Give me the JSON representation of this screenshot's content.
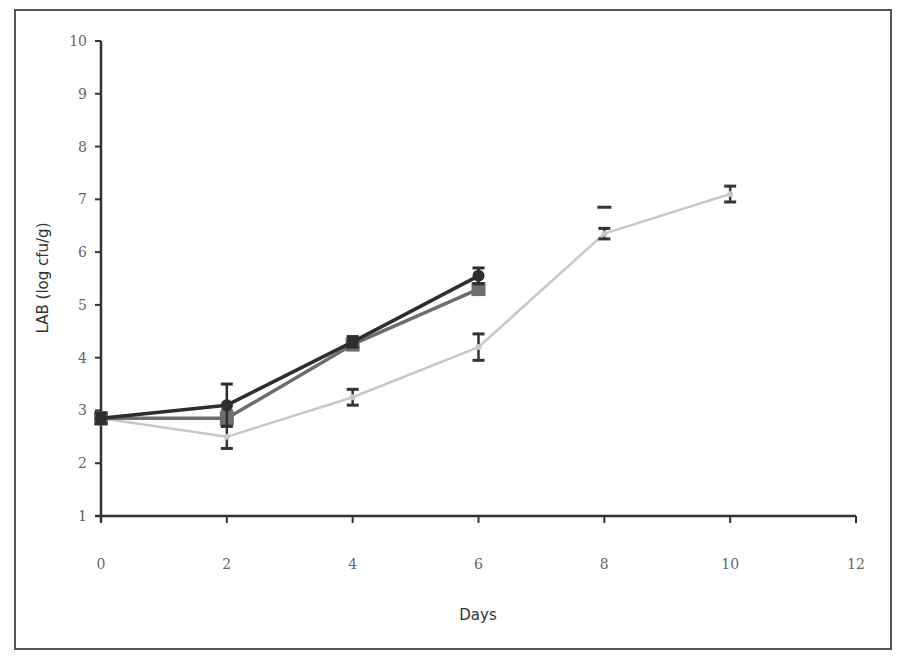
{
  "chart_data": {
    "type": "line",
    "title": "",
    "xlabel": "Days",
    "ylabel": "LAB (log cfu/g)",
    "xlim": [
      0,
      12
    ],
    "ylim": [
      1,
      10
    ],
    "x_ticks": [
      0,
      2,
      4,
      6,
      8,
      10,
      12
    ],
    "y_ticks": [
      1,
      2,
      3,
      4,
      5,
      6,
      7,
      8,
      9,
      10
    ],
    "grid": false,
    "legend": null,
    "series": [
      {
        "name": "Series 1 (dark, triangle/circle markers)",
        "color": "#2e2e2e",
        "x": [
          0,
          2,
          4,
          6
        ],
        "y": [
          2.85,
          3.1,
          4.3,
          5.55
        ],
        "error": [
          0.1,
          0.4,
          0.1,
          0.15
        ]
      },
      {
        "name": "Series 2 (medium grey, square markers)",
        "color": "#6e6e6e",
        "x": [
          0,
          2,
          4,
          6
        ],
        "y": [
          2.85,
          2.85,
          4.25,
          5.3
        ],
        "error": [
          0.1,
          0.15,
          0.1,
          0.1
        ]
      },
      {
        "name": "Series 3 (light grey)",
        "color": "#c8c8c8",
        "x": [
          0,
          2,
          4,
          6,
          8,
          10
        ],
        "y": [
          2.85,
          2.5,
          3.25,
          4.2,
          6.35,
          7.1
        ],
        "error": [
          0.1,
          0.22,
          0.15,
          0.25,
          0.1,
          0.15
        ]
      }
    ],
    "extra_error_caps": [
      {
        "x": 8,
        "y": 6.85,
        "note": "upper cap visible above day-8 point"
      }
    ]
  }
}
